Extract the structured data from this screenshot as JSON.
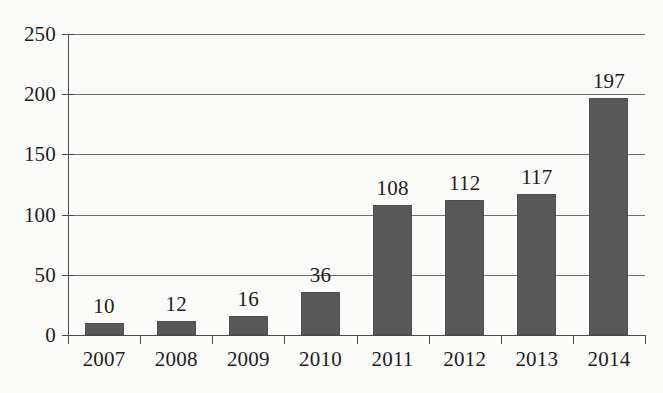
{
  "chart_data": {
    "type": "bar",
    "title": "",
    "subtitle": "",
    "xlabel": "",
    "ylabel": "",
    "categories": [
      "2007",
      "2008",
      "2009",
      "2010",
      "2011",
      "2012",
      "2013",
      "2014"
    ],
    "values": [
      10,
      12,
      16,
      36,
      108,
      112,
      117,
      197
    ],
    "value_labels": [
      "10",
      "12",
      "16",
      "36",
      "108",
      "112",
      "117",
      "197"
    ],
    "ylim": [
      0,
      250
    ],
    "ytick_labels": [
      "0",
      "50",
      "100",
      "150",
      "200",
      "250"
    ],
    "yticks": [
      0,
      50,
      100,
      150,
      200,
      250
    ],
    "grid": "horizontal",
    "legend": "none",
    "annotations": [],
    "colors": {
      "bar_fill": "#585858",
      "bar_edge": "#4f4f4f",
      "gridline": "#6f6f6f",
      "axis": "#4a4a4a",
      "text": "#1c1c1c",
      "background": "#fbfbfa"
    }
  }
}
